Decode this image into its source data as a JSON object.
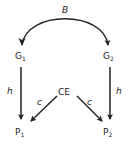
{
  "diagram": {
    "top_label": "B",
    "nodes": {
      "g1": {
        "base": "G",
        "sub": "1"
      },
      "g2": {
        "base": "G",
        "sub": "2"
      },
      "ce": {
        "label": "CE"
      },
      "p1": {
        "base": "P",
        "sub": "1"
      },
      "p2": {
        "base": "P",
        "sub": "2"
      }
    },
    "edge_labels": {
      "g1_p1": "h",
      "g2_p2": "h",
      "ce_p1": "c",
      "ce_p2": "c"
    },
    "edges": [
      {
        "from": "G1",
        "to": "G2",
        "label": "B",
        "style": "curved-bidirectional"
      },
      {
        "from": "G1",
        "to": "P1",
        "label": "h"
      },
      {
        "from": "G2",
        "to": "P2",
        "label": "h"
      },
      {
        "from": "CE",
        "to": "P1",
        "label": "c"
      },
      {
        "from": "CE",
        "to": "P2",
        "label": "c"
      }
    ],
    "colors": {
      "ink": "#222222",
      "background": "#ffffff"
    }
  }
}
